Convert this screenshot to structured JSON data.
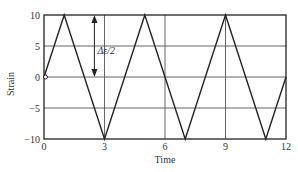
{
  "chart_data": {
    "type": "line",
    "title": "",
    "xlabel": "Time",
    "ylabel": "Strain",
    "xlim": [
      0,
      12
    ],
    "ylim": [
      -10,
      10
    ],
    "x_ticks": [
      0,
      3,
      6,
      9,
      12
    ],
    "y_ticks": [
      10,
      5,
      0,
      -5,
      -10
    ],
    "x_tick_labels": [
      "0",
      "3",
      "6",
      "9",
      "12"
    ],
    "y_tick_labels": [
      "10",
      "5",
      "0",
      "−5",
      "−10"
    ],
    "grid": true,
    "legend": null,
    "series": [
      {
        "name": "strain",
        "x": [
          0,
          1,
          3,
          5,
          7,
          9,
          11,
          12
        ],
        "y": [
          0,
          10,
          -10,
          10,
          -10,
          10,
          -10,
          0
        ],
        "color": "#222222"
      }
    ],
    "annotations": [
      {
        "type": "double-arrow",
        "x": 2.5,
        "y_from": 0,
        "y_to": 10,
        "label": "Δε/2"
      },
      {
        "type": "marker",
        "shape": "open-circle",
        "x": 0,
        "y": 0
      }
    ]
  },
  "labels": {
    "xlabel": "Time",
    "ylabel": "Strain",
    "annotation": "Δε/2"
  }
}
